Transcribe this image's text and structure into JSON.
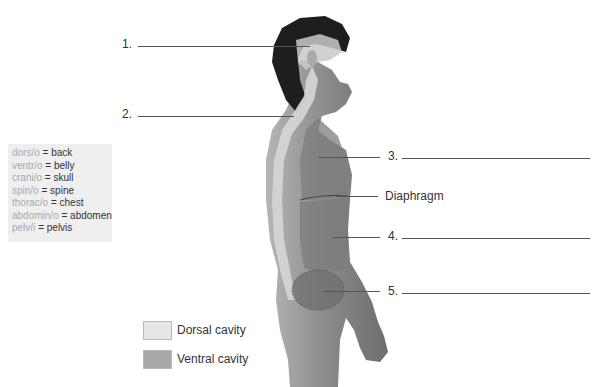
{
  "diagram": {
    "numbered_blanks": [
      {
        "number": "1.",
        "answer": ""
      },
      {
        "number": "2.",
        "answer": ""
      },
      {
        "number": "3.",
        "answer": ""
      },
      {
        "number": "4.",
        "answer": ""
      },
      {
        "number": "5.",
        "answer": ""
      }
    ],
    "fixed_labels": {
      "diaphragm": "Diaphragm"
    },
    "word_roots": [
      {
        "root": "dors/o",
        "eq": "=",
        "meaning": "back"
      },
      {
        "root": "ventr/o",
        "eq": "=",
        "meaning": "belly"
      },
      {
        "root": "crani/o",
        "eq": "=",
        "meaning": "skull"
      },
      {
        "root": "spin/o",
        "eq": "=",
        "meaning": "spine"
      },
      {
        "root": "thorac/o",
        "eq": "=",
        "meaning": "chest"
      },
      {
        "root": "abdomin/o",
        "eq": "=",
        "meaning": "abdomen"
      },
      {
        "root": "pelv/i",
        "eq": "=",
        "meaning": "pelvis"
      }
    ],
    "legend": [
      {
        "label": "Dorsal cavity",
        "color": "#e6e6e6"
      },
      {
        "label": "Ventral cavity",
        "color": "#a9a9a9"
      }
    ],
    "colors": {
      "skin": "#8c8c8c",
      "hair": "#1e1e1e",
      "dorsal_cavity": "#cfcfcf",
      "ventral_cavity": "#7a7a7a",
      "line": "#555555"
    }
  }
}
